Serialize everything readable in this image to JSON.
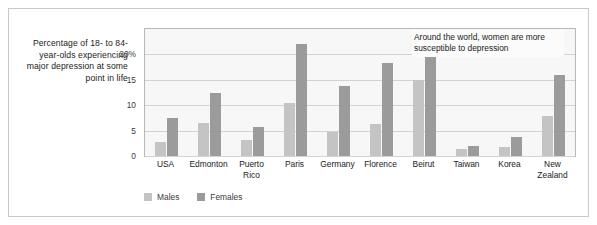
{
  "chart_data": {
    "type": "bar",
    "title": "",
    "xlabel": "",
    "ylabel": "Percentage of 18- to 84-year-olds experiencing major depression at some point in life",
    "ylim": [
      0,
      25
    ],
    "yticks": [
      0,
      5,
      10,
      15,
      20
    ],
    "ytick_labels": [
      "0",
      "5",
      "10",
      "15",
      "20%"
    ],
    "grid": true,
    "legend_position": "bottom-left",
    "categories": [
      "USA",
      "Edmonton",
      "Puerto Rico",
      "Paris",
      "Germany",
      "Florence",
      "Beirut",
      "Taiwan",
      "Korea",
      "New Zealand"
    ],
    "series": [
      {
        "name": "Males",
        "color": "#c4c4c4",
        "values": [
          2.8,
          6.5,
          3.1,
          10.5,
          4.7,
          6.4,
          15.0,
          1.3,
          1.7,
          7.8
        ]
      },
      {
        "name": "Females",
        "color": "#9b9b9b",
        "values": [
          7.5,
          12.5,
          5.7,
          22.0,
          13.7,
          18.3,
          23.4,
          2.0,
          3.8,
          16.0
        ]
      }
    ],
    "annotations": [
      {
        "text": "Around the world, women are more susceptible to depression"
      }
    ]
  },
  "axis": {
    "title": "Percentage of 18- to 84-year-olds experiencing major depression at some point in life"
  },
  "annotation": {
    "text": "Around the world, women are more susceptible to depression"
  },
  "legend": {
    "items": [
      {
        "label": "Males"
      },
      {
        "label": "Females"
      }
    ]
  },
  "colors": {
    "male_bar": "#c4c4c4",
    "female_bar": "#9b9b9b",
    "plot_background": "#f7f7f7",
    "gridline": "#d2d2d2",
    "frame": "#c9c9c9"
  }
}
